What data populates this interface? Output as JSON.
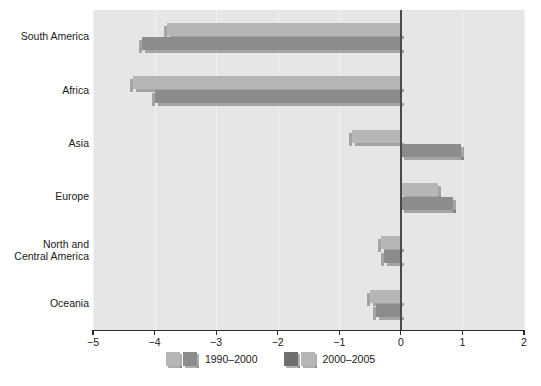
{
  "chart_data": {
    "type": "bar",
    "orientation": "horizontal",
    "title": "",
    "subtitle": "",
    "xlabel": "",
    "ylabel": "",
    "xlim": [
      -5,
      2
    ],
    "xticks": [
      -5,
      -4,
      -3,
      -2,
      -1,
      0,
      1,
      2
    ],
    "xtick_labels": [
      "−5",
      "−4",
      "−3",
      "−2",
      "−1",
      "0",
      "1",
      "2"
    ],
    "grid": true,
    "grid_axis": "x",
    "zero_line": 0,
    "legend_position": "bottom-center",
    "categories": [
      "South America",
      "Africa",
      "Asia",
      "Europe",
      "North and\nCentral America",
      "Oceania"
    ],
    "series": [
      {
        "name": "1990–2000",
        "color": "#b6b6b6",
        "values": [
          -3.8,
          -4.35,
          -0.8,
          0.6,
          -0.33,
          -0.5
        ]
      },
      {
        "name": "2000–2005",
        "color": "#8c8c8c",
        "values": [
          -4.2,
          -4.0,
          0.97,
          0.84,
          -0.28,
          -0.4
        ]
      }
    ],
    "annotations": []
  },
  "legend": {
    "items": [
      {
        "label": "1990–2000",
        "swatch_front": "#b6b6b6",
        "swatch_back": "#8c8c8c"
      },
      {
        "label": "2000–2005",
        "swatch_front": "#6f6f6f",
        "swatch_back": "#b6b6b6"
      }
    ]
  },
  "axis": {
    "tick_labels": [
      "−5",
      "−4",
      "−3",
      "−2",
      "−1",
      "0",
      "1",
      "2"
    ]
  },
  "caption": {
    "text": ""
  },
  "colors": {
    "plot_background": "#e6e6e6",
    "page_background": "#ffffff",
    "gridline": "#f2f2f2",
    "zero_line": "#4a4a4a",
    "axis_line": "#2b2b2b",
    "text": "#1a1a1a",
    "bar_light": "#b6b6b6",
    "bar_dark": "#8c8c8c",
    "bar_shadow": "#6e6e6e"
  }
}
